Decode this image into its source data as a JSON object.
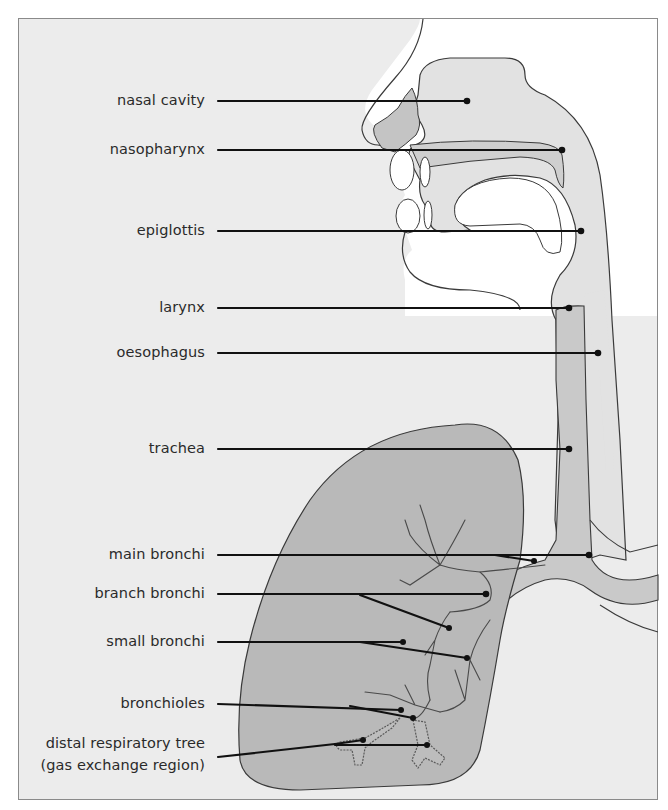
{
  "diagram": {
    "colors": {
      "background": "#ececec",
      "head_white": "#ffffff",
      "tissue_light": "#e2e2e2",
      "tissue_mid": "#c9c9c9",
      "lung": "#b9b9b9",
      "outline": "#3a3a3a",
      "leader": "#111111",
      "text": "#2a2a2a"
    },
    "labels": [
      {
        "id": "nasal-cavity",
        "text": "nasal cavity",
        "y": 101,
        "target": [
          467,
          101
        ]
      },
      {
        "id": "nasopharynx",
        "text": "nasopharynx",
        "y": 150,
        "target": [
          562,
          150
        ]
      },
      {
        "id": "epiglottis",
        "text": "epiglottis",
        "y": 231,
        "target": [
          581,
          231
        ]
      },
      {
        "id": "larynx",
        "text": "larynx",
        "y": 308,
        "target": [
          569,
          308
        ]
      },
      {
        "id": "oesophagus",
        "text": "oesophagus",
        "y": 353,
        "target": [
          598,
          353
        ]
      },
      {
        "id": "trachea",
        "text": "trachea",
        "y": 449,
        "target": [
          569,
          449
        ]
      },
      {
        "id": "main-bronchi",
        "text": "main bronchi",
        "y": 555,
        "target": [
          589,
          555
        ]
      },
      {
        "id": "branch-bronchi",
        "text": "branch bronchi",
        "y": 594,
        "target": [
          486,
          594
        ]
      },
      {
        "id": "small-bronchi",
        "text": "small bronchi",
        "y": 642,
        "target": [
          403,
          642
        ]
      },
      {
        "id": "bronchioles",
        "text": "bronchioles",
        "y": 704,
        "target": [
          401,
          710
        ]
      },
      {
        "id": "distal-respiratory-tree",
        "text": "distal respiratory tree",
        "text2": "(gas exchange region)",
        "y": 745,
        "target": [
          427,
          745
        ]
      }
    ]
  }
}
